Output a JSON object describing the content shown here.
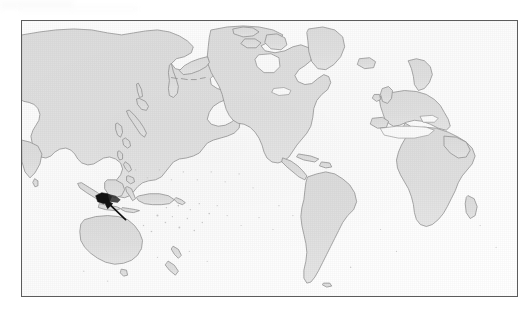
{
  "figure": {
    "kind": "world-map",
    "title": "",
    "caption": "",
    "projection": "equirectangular",
    "center_longitude": 180,
    "frame": {
      "x": 21,
      "y": 20,
      "width": 497,
      "height": 277,
      "border_color": "#5c5c5c",
      "border_width_px": 1
    },
    "colors": {
      "ocean": "#ffffff",
      "land_fill": "#dedede",
      "coastline": "#8e8e8e",
      "frame": "#5c5c5c",
      "marker": "#111111",
      "page_background": "#ffffff"
    }
  },
  "map": {
    "name": "pacific-centered-world-map",
    "longitude_range": [
      -40,
      320
    ],
    "latitude_range": [
      -60,
      80
    ],
    "graticule_visible": false,
    "labels_visible": false,
    "landmasses": [
      {
        "name": "Asia"
      },
      {
        "name": "Europe"
      },
      {
        "name": "Africa"
      },
      {
        "name": "North America"
      },
      {
        "name": "South America"
      },
      {
        "name": "Australia"
      },
      {
        "name": "Greenland"
      },
      {
        "name": "Iceland"
      },
      {
        "name": "Japan"
      },
      {
        "name": "Philippines"
      },
      {
        "name": "Indonesia"
      },
      {
        "name": "New Guinea"
      },
      {
        "name": "New Zealand"
      },
      {
        "name": "Madagascar"
      },
      {
        "name": "Great Britain"
      },
      {
        "name": "Sri Lanka"
      },
      {
        "name": "Cuba"
      },
      {
        "name": "Borneo"
      },
      {
        "name": "Sumatra"
      },
      {
        "name": "Pacific Islands"
      }
    ]
  },
  "annotation": {
    "type": "arrow-marker",
    "label": "",
    "target_region": "New Guinea",
    "marker_color": "#111111",
    "arrow_tail": {
      "x": 124,
      "y": 219
    },
    "arrow_head": {
      "x": 97,
      "y": 198
    }
  }
}
